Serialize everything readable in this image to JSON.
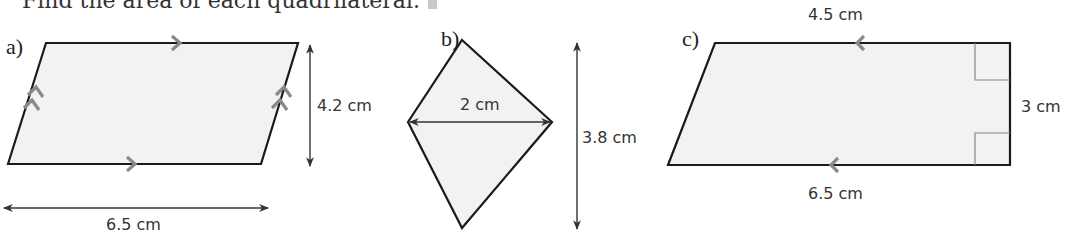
{
  "heading": {
    "text": "Find the area of each quadrilateral.",
    "icon": "info-square-icon"
  },
  "shapes": [
    {
      "label": "a)",
      "type": "parallelogram",
      "dimensions": {
        "base": "6.5 cm",
        "height": "4.2 cm"
      },
      "markings": [
        "single-chevron parallel marks on top and bottom sides",
        "double-chevron parallel marks on slanted sides"
      ]
    },
    {
      "label": "b)",
      "type": "kite",
      "dimensions": {
        "width_diagonal": "2 cm",
        "height_diagonal": "3.8 cm"
      }
    },
    {
      "label": "c)",
      "type": "trapezium",
      "dimensions": {
        "top": "4.5 cm",
        "bottom": "6.5 cm",
        "height": "3 cm"
      },
      "markings": [
        "parallel chevrons pointing left on top and bottom sides",
        "two right-angle marks on right side"
      ]
    }
  ],
  "colors": {
    "fill": "#f2f2f2",
    "outline": "#1a1a1a",
    "parallel_mark": "#8a8a8a",
    "dimension_line": "#333333"
  }
}
